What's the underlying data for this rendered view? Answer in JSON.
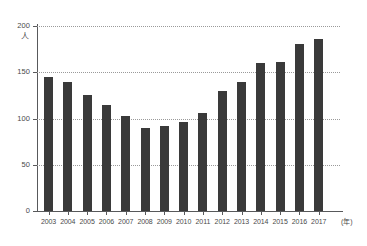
{
  "chart_data": {
    "type": "bar",
    "title": "",
    "subtitle": "",
    "xlabel": "(年)",
    "ylabel": "(人)",
    "y_unit": "人",
    "x_unit": "年",
    "categories": [
      "2003",
      "2004",
      "2005",
      "2006",
      "2007",
      "2008",
      "2009",
      "2010",
      "2011",
      "2012",
      "2013",
      "2014",
      "2015",
      "2016",
      "2017"
    ],
    "values": [
      145,
      139,
      125,
      115,
      103,
      90,
      92,
      96,
      106,
      130,
      140,
      160,
      161,
      181,
      186
    ],
    "series": [
      {
        "name": "",
        "values": [
          145,
          139,
          125,
          115,
          103,
          90,
          92,
          96,
          106,
          130,
          140,
          160,
          161,
          181,
          186
        ]
      }
    ],
    "ylim": [
      0,
      200
    ],
    "y_ticks": [
      0,
      50,
      100,
      150,
      200
    ],
    "y_tick_labels": [
      "0",
      "50",
      "100",
      "150",
      "200"
    ],
    "grid": true,
    "grid_axis": "y",
    "grid_style": "dotted",
    "legend": false,
    "legend_position": "none",
    "bar_color": "#3a3a3a",
    "axis_color": "#58595b",
    "grid_color": "#9a9a9a",
    "background_color": "#ffffff",
    "text_color": "#4a4a4a"
  }
}
